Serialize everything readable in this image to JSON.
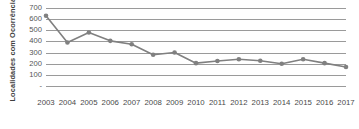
{
  "chart_data": {
    "type": "line",
    "title": "",
    "xlabel": "",
    "ylabel": "Localidades com Ocorrências",
    "categories": [
      "2003",
      "2004",
      "2005",
      "2006",
      "2007",
      "2008",
      "2009",
      "2010",
      "2011",
      "2012",
      "2013",
      "2014",
      "2015",
      "2016",
      "2017"
    ],
    "values": [
      630,
      390,
      480,
      405,
      375,
      280,
      300,
      205,
      225,
      240,
      227,
      200,
      240,
      205,
      170
    ],
    "series": [
      {
        "name": "Localidades com Ocorrências",
        "values": [
          630,
          390,
          480,
          405,
          375,
          280,
          300,
          205,
          225,
          240,
          227,
          200,
          240,
          205,
          170
        ]
      }
    ],
    "ylim": [
      0,
      700
    ],
    "y_ticks": [
      700,
      600,
      500,
      400,
      300,
      200,
      100,
      0
    ],
    "y_tick_labels": [
      "700",
      "600",
      "500",
      "400",
      "300",
      "200",
      "100",
      "-"
    ],
    "grid": true,
    "legend": "none",
    "line_color": "#808080",
    "marker_color": "#808080",
    "grid_color": "#9a9a9a",
    "background_color": "#ffffff"
  }
}
